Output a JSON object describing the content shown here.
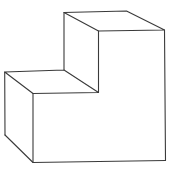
{
  "figure": {
    "type": "isometric-step-block",
    "background": "#ffffff",
    "stroke_color": "#3a3a3a",
    "vertices": {
      "upper_back_left": [
        64,
        12.5
      ],
      "upper_back_right": [
        126.5,
        11
      ],
      "upper_front_left": [
        98.5,
        31
      ],
      "upper_front_right": [
        164.5,
        30
      ],
      "step_back_left": [
        4.7,
        72
      ],
      "step_back_right": [
        64,
        70
      ],
      "step_front_left": [
        33,
        93.5
      ],
      "step_front_right": [
        98.5,
        92.5
      ],
      "bottom_back_left": [
        5,
        135
      ],
      "bottom_front_left": [
        33,
        162.5
      ],
      "bottom_front_right": [
        165.5,
        160.5
      ]
    }
  }
}
